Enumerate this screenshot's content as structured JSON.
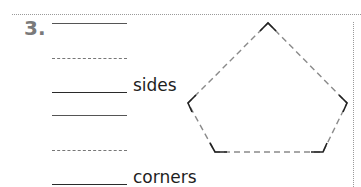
{
  "problem": {
    "number": "3.",
    "answer_blocks": [
      {
        "label": "sides"
      },
      {
        "label": "corners"
      }
    ]
  },
  "figure": {
    "shape": "pentagon",
    "style": "dashed sides with solid corners",
    "vertices": [
      [
        268,
        23
      ],
      [
        347,
        103
      ],
      [
        323,
        152
      ],
      [
        215,
        152
      ],
      [
        188,
        103
      ]
    ],
    "colors": {
      "corner": "#222222",
      "side": "#8a8a8a"
    }
  }
}
